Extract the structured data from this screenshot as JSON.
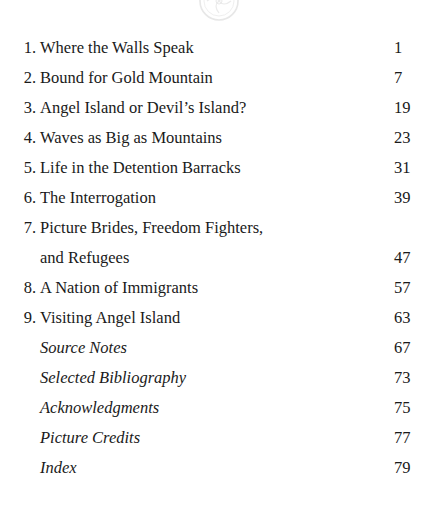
{
  "document": {
    "type": "table-of-contents",
    "background_color": "#ffffff",
    "text_color": "#1a1a1a"
  },
  "ornament": {
    "name": "circular-medallion-ornament",
    "color": "#d8d8d8",
    "description": "faint light-gray circular decorative medallion, clipped by top page edge"
  },
  "contents": {
    "entries": [
      {
        "number": "1.",
        "lines": [
          "Where the Walls Speak"
        ],
        "page": "1",
        "style": "roman"
      },
      {
        "number": "2.",
        "lines": [
          "Bound for Gold Mountain"
        ],
        "page": "7",
        "style": "roman"
      },
      {
        "number": "3.",
        "lines": [
          "Angel Island or Devil’s Island?"
        ],
        "page": "19",
        "style": "roman"
      },
      {
        "number": "4.",
        "lines": [
          "Waves as Big as Mountains"
        ],
        "page": "23",
        "style": "roman"
      },
      {
        "number": "5.",
        "lines": [
          "Life in the Detention Barracks"
        ],
        "page": "31",
        "style": "roman"
      },
      {
        "number": "6.",
        "lines": [
          "The Interrogation"
        ],
        "page": "39",
        "style": "roman"
      },
      {
        "number": "7.",
        "lines": [
          "Picture Brides, Freedom Fighters,",
          "and Refugees"
        ],
        "page": "47",
        "style": "roman"
      },
      {
        "number": "8.",
        "lines": [
          "A Nation of Immigrants"
        ],
        "page": "57",
        "style": "roman"
      },
      {
        "number": "9.",
        "lines": [
          "Visiting Angel Island"
        ],
        "page": "63",
        "style": "roman"
      },
      {
        "number": "",
        "lines": [
          "Source Notes"
        ],
        "page": "67",
        "style": "italic"
      },
      {
        "number": "",
        "lines": [
          "Selected Bibliography"
        ],
        "page": "73",
        "style": "italic"
      },
      {
        "number": "",
        "lines": [
          "Acknowledgments"
        ],
        "page": "75",
        "style": "italic"
      },
      {
        "number": "",
        "lines": [
          "Picture Credits"
        ],
        "page": "77",
        "style": "italic"
      },
      {
        "number": "",
        "lines": [
          "Index"
        ],
        "page": "79",
        "style": "italic"
      }
    ]
  }
}
